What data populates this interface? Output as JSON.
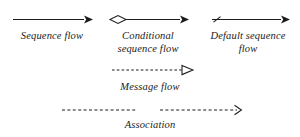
{
  "diagram": {
    "background_color": "#ffffff",
    "stroke_color": "#1c1c1c",
    "items": [
      {
        "id": "sequence-flow",
        "label": "Sequence flow",
        "line_style": "solid",
        "source_marker": "none",
        "target_marker": "filled-arrowhead"
      },
      {
        "id": "conditional-sequence-flow",
        "label": "Conditional\nsequence flow",
        "line_style": "solid",
        "source_marker": "hollow-diamond",
        "target_marker": "filled-arrowhead"
      },
      {
        "id": "default-sequence-flow",
        "label": "Default sequence\nflow",
        "line_style": "solid",
        "source_marker": "slash-tick",
        "target_marker": "filled-arrowhead"
      },
      {
        "id": "message-flow",
        "label": "Message flow",
        "line_style": "dashed",
        "source_marker": "none",
        "target_marker": "hollow-arrowhead"
      },
      {
        "id": "association",
        "label": "Association",
        "line_style": "dashed",
        "source_marker": "none",
        "target_marker": "open-line-arrowhead"
      }
    ]
  }
}
